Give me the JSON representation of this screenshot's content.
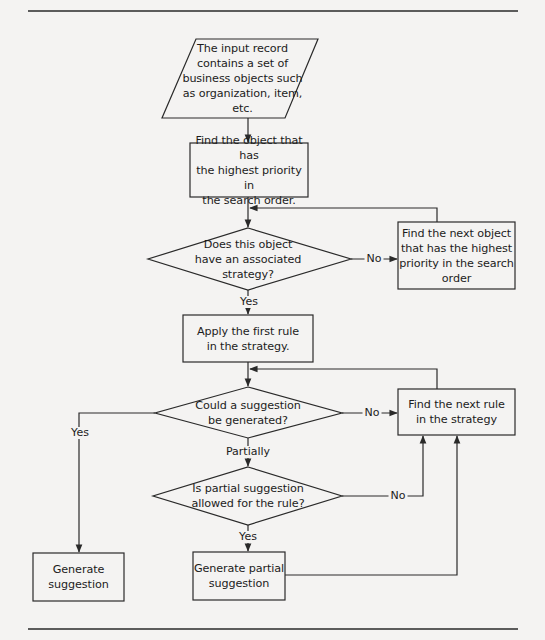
{
  "flowchart": {
    "nodes": {
      "input": {
        "shape": "parallelogram",
        "text": "The input record\ncontains a set of\nbusiness objects such\nas organization, item,\netc."
      },
      "find_highest": {
        "shape": "rectangle",
        "text": "Find the object that has\nthe highest priority in\nthe search order."
      },
      "has_strategy": {
        "shape": "diamond",
        "text": "Does this object\nhave an associated\nstrategy?"
      },
      "find_next_object": {
        "shape": "rectangle",
        "text": "Find the next object\nthat has the highest\npriority in the search\norder"
      },
      "apply_first_rule": {
        "shape": "rectangle",
        "text": "Apply the first rule\nin the strategy."
      },
      "could_generate": {
        "shape": "diamond",
        "text": "Could a suggestion\nbe generated?"
      },
      "find_next_rule": {
        "shape": "rectangle",
        "text": "Find the next rule\nin the strategy"
      },
      "partial_allowed": {
        "shape": "diamond",
        "text": "Is partial suggestion\nallowed for the rule?"
      },
      "generate_suggestion": {
        "shape": "rectangle",
        "text": "Generate\nsuggestion"
      },
      "generate_partial": {
        "shape": "rectangle",
        "text": "Generate partial\nsuggestion"
      }
    },
    "edges": [
      {
        "from": "input",
        "to": "find_highest",
        "label": ""
      },
      {
        "from": "find_highest",
        "to": "has_strategy",
        "label": ""
      },
      {
        "from": "has_strategy",
        "to": "find_next_object",
        "label": "No"
      },
      {
        "from": "find_next_object",
        "to": "has_strategy",
        "label": ""
      },
      {
        "from": "has_strategy",
        "to": "apply_first_rule",
        "label": "Yes"
      },
      {
        "from": "apply_first_rule",
        "to": "could_generate",
        "label": ""
      },
      {
        "from": "could_generate",
        "to": "find_next_rule",
        "label": "No"
      },
      {
        "from": "find_next_rule",
        "to": "could_generate",
        "label": ""
      },
      {
        "from": "could_generate",
        "to": "generate_suggestion",
        "label": "Yes"
      },
      {
        "from": "could_generate",
        "to": "partial_allowed",
        "label": "Partially"
      },
      {
        "from": "partial_allowed",
        "to": "find_next_rule",
        "label": "No"
      },
      {
        "from": "partial_allowed",
        "to": "generate_partial",
        "label": "Yes"
      },
      {
        "from": "generate_partial",
        "to": "find_next_rule",
        "label": ""
      }
    ],
    "labels": {
      "no_1": "No",
      "yes_1": "Yes",
      "no_2": "No",
      "yes_2": "Yes",
      "partially": "Partially",
      "no_3": "No",
      "yes_3": "Yes"
    },
    "colors": {
      "background": "#f4f3f2",
      "stroke": "#2a2a2a",
      "text": "#1c1c1c"
    }
  }
}
